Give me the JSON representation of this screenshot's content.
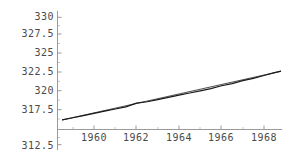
{
  "chart_data": {
    "type": "line",
    "title": "",
    "xlabel": "",
    "ylabel": "",
    "xlim": [
      1958.4,
      1969.2
    ],
    "ylim": [
      312.5,
      330.0
    ],
    "grid": false,
    "legend": null,
    "y_ticks": [
      330,
      327.5,
      325,
      322.5,
      320,
      317.5,
      312.5
    ],
    "y_tick_labels": [
      "330",
      "327.5",
      "325",
      "322.5",
      "320",
      "317.5",
      "312.5"
    ],
    "y_tick_hidden": [
      315
    ],
    "x_ticks": [
      1960,
      1962,
      1964,
      1966,
      1968
    ],
    "x_tick_labels": [
      "1960",
      "1962",
      "1964",
      "1966",
      "1968"
    ],
    "x_axis_crosses_y_at": 315,
    "series": [
      {
        "name": "data",
        "color": "#1a1a1a",
        "x": [
          1958.5,
          1959.0,
          1959.5,
          1960.0,
          1960.5,
          1961.0,
          1961.5,
          1962.0,
          1962.5,
          1963.0,
          1963.5,
          1964.0,
          1964.5,
          1965.0,
          1965.5,
          1966.0,
          1966.5,
          1967.0,
          1967.5,
          1968.0,
          1968.5,
          1968.8
        ],
        "values": [
          315.9,
          316.2,
          316.5,
          316.8,
          317.1,
          317.4,
          317.7,
          318.2,
          318.4,
          318.7,
          319.0,
          319.3,
          319.6,
          319.9,
          320.2,
          320.6,
          320.9,
          321.3,
          321.6,
          322.0,
          322.4,
          322.6
        ]
      },
      {
        "name": "fit",
        "color": "#555555",
        "x": [
          1958.5,
          1968.8
        ],
        "values": [
          315.9,
          322.6
        ]
      }
    ]
  },
  "axis": {
    "y_axis_color": "#9a9a9a",
    "x_axis_color": "#9a9a9a",
    "tick_color": "#9a9a9a",
    "label_color": "#4a4a4a"
  }
}
